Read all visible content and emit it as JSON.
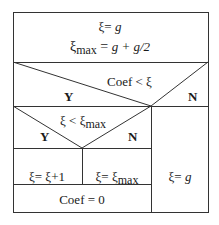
{
  "diagram": {
    "type": "nassi-shneiderman",
    "init_block": {
      "line1": {
        "var": "ξ",
        "eq": "= ",
        "value": "g"
      },
      "line2": {
        "var": "ξ",
        "sub": "max",
        "eq": " = ",
        "value": "g + g/2"
      }
    },
    "outer_condition": {
      "text": "Coef <  ξ",
      "yes": "Y",
      "no": "N"
    },
    "inner_condition": {
      "text_pre": "ξ  <  ξ",
      "sub": "max",
      "yes": "Y",
      "no": "N"
    },
    "inner_yes_action": {
      "text": "ξ= ξ+1"
    },
    "inner_no_action": {
      "pre": "ξ= ξ",
      "sub": "max"
    },
    "after_inner": {
      "text": "Coef = 0"
    },
    "outer_no_action": {
      "pre": "ξ= ",
      "value": "g"
    }
  }
}
